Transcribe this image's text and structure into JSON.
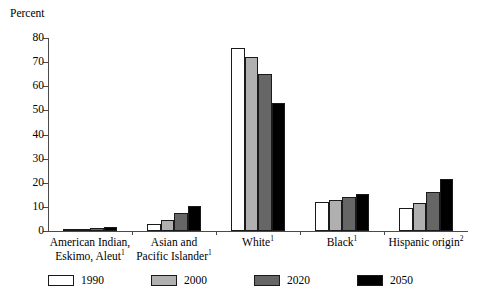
{
  "chart_data": {
    "type": "bar",
    "title": "",
    "xlabel": "",
    "ylabel": "Percent",
    "ylim": [
      0,
      80
    ],
    "ytick_labels": [
      "80",
      "70",
      "60",
      "50",
      "40",
      "30",
      "20",
      "10",
      "0"
    ],
    "yticks": [
      80,
      70,
      60,
      50,
      40,
      30,
      20,
      10,
      0
    ],
    "grid": false,
    "legend_position": "bottom",
    "categories": [
      "American Indian, Eskimo, Aleut",
      "Asian and Pacific Islander",
      "White",
      "Black",
      "Hispanic origin"
    ],
    "category_footnotes": [
      "1",
      "1",
      "1",
      "1",
      "2"
    ],
    "category_lines": [
      [
        "American Indian,",
        "Eskimo, Aleut"
      ],
      [
        "Asian and",
        "Pacific Islander"
      ],
      [
        "White"
      ],
      [
        "Black"
      ],
      [
        "Hispanic origin"
      ]
    ],
    "series": [
      {
        "name": "1990",
        "color": "#ffffff",
        "values": [
          0.9,
          3.0,
          76.0,
          12.1,
          9.5
        ]
      },
      {
        "name": "2000",
        "color": "#b0b0b0",
        "values": [
          1.0,
          4.5,
          72.0,
          12.8,
          11.5
        ]
      },
      {
        "name": "2020",
        "color": "#666666",
        "values": [
          1.1,
          7.5,
          65.0,
          14.0,
          16.0
        ]
      },
      {
        "name": "2050",
        "color": "#000000",
        "values": [
          1.6,
          10.5,
          53.0,
          15.5,
          21.5
        ]
      }
    ]
  },
  "legend": {
    "entries": [
      {
        "label": "1990",
        "color": "#ffffff"
      },
      {
        "label": "2000",
        "color": "#b0b0b0"
      },
      {
        "label": "2020",
        "color": "#666666"
      },
      {
        "label": "2050",
        "color": "#000000"
      }
    ]
  }
}
